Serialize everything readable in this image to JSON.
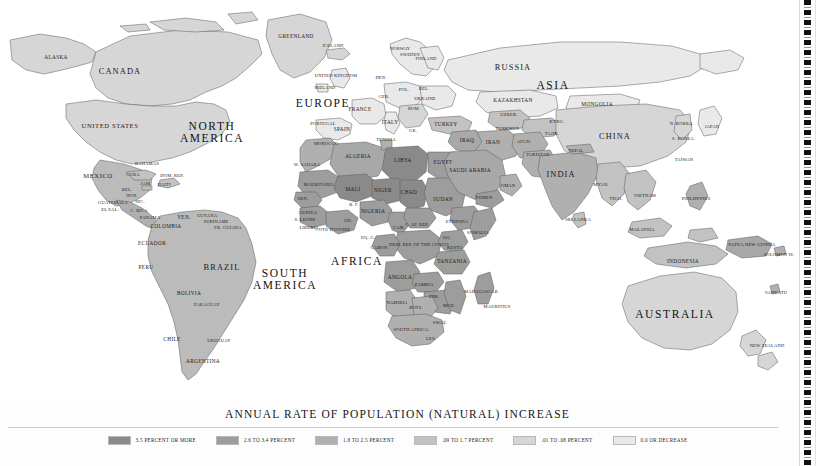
{
  "legend": {
    "title": "ANNUAL RATE OF POPULATION (NATURAL) INCREASE",
    "items": [
      {
        "label": "3.5 PERCENT OR MORE",
        "color": "#8a8a8a"
      },
      {
        "label": "2.6 TO 3.4 PERCENT",
        "color": "#9d9d9d"
      },
      {
        "label": "1.8 TO 2.5 PERCENT",
        "color": "#b0b0b0"
      },
      {
        "label": ".09 TO 1.7 PERCENT",
        "color": "#c2c2c2"
      },
      {
        "label": ".01 TO .08 PERCENT",
        "color": "#d6d6d6"
      },
      {
        "label": "0.0 OR DECREASE",
        "color": "#e9e9e9"
      }
    ]
  },
  "map": {
    "ocean_color": "#ffffff",
    "border_color": "#4a4a4a",
    "continents": [
      {
        "name": "NORTH\nAMERICA",
        "x": 212,
        "y": 133
      },
      {
        "name": "SOUTH\nAMERICA",
        "x": 285,
        "y": 280
      },
      {
        "name": "EUROPE",
        "x": 323,
        "y": 104
      },
      {
        "name": "AFRICA",
        "x": 357,
        "y": 262
      },
      {
        "name": "ASIA",
        "x": 553,
        "y": 86
      },
      {
        "name": "AUSTRALIA",
        "x": 675,
        "y": 315
      }
    ],
    "countries": [
      {
        "name": "ALASKA",
        "x": 56,
        "y": 58,
        "size": "c-sm"
      },
      {
        "name": "CANADA",
        "x": 120,
        "y": 72,
        "size": "c-big"
      },
      {
        "name": "UNITED STATES",
        "x": 110,
        "y": 126,
        "size": "c-mid"
      },
      {
        "name": "MEXICO",
        "x": 98,
        "y": 176,
        "size": "c-mid"
      },
      {
        "name": "GREENLAND",
        "x": 296,
        "y": 37,
        "size": "c-sm"
      },
      {
        "name": "ICELAND",
        "x": 333,
        "y": 46,
        "size": "c-xs"
      },
      {
        "name": "BAHAMAS",
        "x": 147,
        "y": 164,
        "size": "c-xs"
      },
      {
        "name": "CUBA",
        "x": 133,
        "y": 175,
        "size": "c-xs"
      },
      {
        "name": "DOM. REP.",
        "x": 172,
        "y": 176,
        "size": "c-xs"
      },
      {
        "name": "JAM.",
        "x": 146,
        "y": 184,
        "size": "c-xs"
      },
      {
        "name": "HAITI",
        "x": 164,
        "y": 185,
        "size": "c-xs"
      },
      {
        "name": "BEL.",
        "x": 127,
        "y": 190,
        "size": "c-xs"
      },
      {
        "name": "HON.",
        "x": 132,
        "y": 196,
        "size": "c-xs"
      },
      {
        "name": "GUATEMALA",
        "x": 113,
        "y": 203,
        "size": "c-xs"
      },
      {
        "name": "EL SAL.",
        "x": 110,
        "y": 210,
        "size": "c-xs"
      },
      {
        "name": "NIC.",
        "x": 140,
        "y": 202,
        "size": "c-xs"
      },
      {
        "name": "C. RICA",
        "x": 139,
        "y": 211,
        "size": "c-xs"
      },
      {
        "name": "PANAMA",
        "x": 150,
        "y": 218,
        "size": "c-xs"
      },
      {
        "name": "VEN.",
        "x": 184,
        "y": 218,
        "size": "c-sm"
      },
      {
        "name": "GUYANA",
        "x": 207,
        "y": 216,
        "size": "c-xs"
      },
      {
        "name": "SURINAME",
        "x": 216,
        "y": 222,
        "size": "c-xs"
      },
      {
        "name": "FR. GUIANA",
        "x": 228,
        "y": 228,
        "size": "c-xs"
      },
      {
        "name": "COLOMBIA",
        "x": 166,
        "y": 227,
        "size": "c-sm"
      },
      {
        "name": "ECUADOR",
        "x": 152,
        "y": 244,
        "size": "c-sm"
      },
      {
        "name": "PERU",
        "x": 146,
        "y": 268,
        "size": "c-sm"
      },
      {
        "name": "BRAZIL",
        "x": 222,
        "y": 268,
        "size": "c-big"
      },
      {
        "name": "BOLIVIA",
        "x": 189,
        "y": 294,
        "size": "c-sm"
      },
      {
        "name": "PARAGUAY",
        "x": 207,
        "y": 305,
        "size": "c-xs"
      },
      {
        "name": "CHILE",
        "x": 172,
        "y": 340,
        "size": "c-sm"
      },
      {
        "name": "URUGUAY",
        "x": 219,
        "y": 341,
        "size": "c-xs"
      },
      {
        "name": "ARGENTINA",
        "x": 203,
        "y": 362,
        "size": "c-sm"
      },
      {
        "name": "NORWAY",
        "x": 400,
        "y": 49,
        "size": "c-xs"
      },
      {
        "name": "SWEDEN",
        "x": 410,
        "y": 55,
        "size": "c-xs"
      },
      {
        "name": "FINLAND",
        "x": 426,
        "y": 59,
        "size": "c-xs"
      },
      {
        "name": "UNITED KINGDOM",
        "x": 336,
        "y": 76,
        "size": "c-xs"
      },
      {
        "name": "IRELAND",
        "x": 325,
        "y": 88,
        "size": "c-xs"
      },
      {
        "name": "DEN.",
        "x": 381,
        "y": 78,
        "size": "c-xs"
      },
      {
        "name": "POL.",
        "x": 404,
        "y": 90,
        "size": "c-xs"
      },
      {
        "name": "BEL.",
        "x": 424,
        "y": 89,
        "size": "c-xs"
      },
      {
        "name": "GER.",
        "x": 384,
        "y": 97,
        "size": "c-xs"
      },
      {
        "name": "UKRAINE",
        "x": 425,
        "y": 99,
        "size": "c-xs"
      },
      {
        "name": "FRANCE",
        "x": 360,
        "y": 110,
        "size": "c-sm"
      },
      {
        "name": "ROM.",
        "x": 414,
        "y": 109,
        "size": "c-xs"
      },
      {
        "name": "PORTUGAL",
        "x": 323,
        "y": 124,
        "size": "c-xs"
      },
      {
        "name": "SPAIN",
        "x": 342,
        "y": 130,
        "size": "c-sm"
      },
      {
        "name": "ITALY",
        "x": 390,
        "y": 123,
        "size": "c-sm"
      },
      {
        "name": "GR.",
        "x": 413,
        "y": 131,
        "size": "c-xs"
      },
      {
        "name": "TURKEY",
        "x": 446,
        "y": 125,
        "size": "c-sm"
      },
      {
        "name": "TUNISIA",
        "x": 386,
        "y": 140,
        "size": "c-xs"
      },
      {
        "name": "MOROCCO",
        "x": 326,
        "y": 144,
        "size": "c-xs"
      },
      {
        "name": "W. SAHARA",
        "x": 307,
        "y": 165,
        "size": "c-xs"
      },
      {
        "name": "ALGERIA",
        "x": 358,
        "y": 157,
        "size": "c-sm"
      },
      {
        "name": "LIBYA",
        "x": 403,
        "y": 161,
        "size": "c-sm"
      },
      {
        "name": "EGYPT",
        "x": 443,
        "y": 163,
        "size": "c-sm"
      },
      {
        "name": "MAURITANIA",
        "x": 319,
        "y": 185,
        "size": "c-xs"
      },
      {
        "name": "MALI",
        "x": 353,
        "y": 190,
        "size": "c-sm"
      },
      {
        "name": "NIGER",
        "x": 383,
        "y": 191,
        "size": "c-sm"
      },
      {
        "name": "CHAD",
        "x": 409,
        "y": 193,
        "size": "c-sm"
      },
      {
        "name": "SUDAN",
        "x": 443,
        "y": 200,
        "size": "c-sm"
      },
      {
        "name": "SEN.",
        "x": 303,
        "y": 199,
        "size": "c-xs"
      },
      {
        "name": "GUINEA",
        "x": 308,
        "y": 213,
        "size": "c-xs"
      },
      {
        "name": "S. LEONE",
        "x": 305,
        "y": 220,
        "size": "c-xs"
      },
      {
        "name": "LIBERIA",
        "x": 309,
        "y": 228,
        "size": "c-xs"
      },
      {
        "name": "B. F.",
        "x": 354,
        "y": 205,
        "size": "c-xs"
      },
      {
        "name": "NIGERIA",
        "x": 373,
        "y": 212,
        "size": "c-sm"
      },
      {
        "name": "GH.",
        "x": 348,
        "y": 221,
        "size": "c-xs"
      },
      {
        "name": "COTE D'IVOIRE",
        "x": 333,
        "y": 230,
        "size": "c-xs"
      },
      {
        "name": "CAM.",
        "x": 399,
        "y": 228,
        "size": "c-xs"
      },
      {
        "name": "C. AF. REP.",
        "x": 417,
        "y": 225,
        "size": "c-xs"
      },
      {
        "name": "ETHIOPIA",
        "x": 457,
        "y": 222,
        "size": "c-xs"
      },
      {
        "name": "SOMALIA",
        "x": 478,
        "y": 233,
        "size": "c-xs"
      },
      {
        "name": "EQ. G.",
        "x": 368,
        "y": 238,
        "size": "c-xs"
      },
      {
        "name": "GABON",
        "x": 379,
        "y": 248,
        "size": "c-xs"
      },
      {
        "name": "DEM. REP. OF THE CONGO",
        "x": 419,
        "y": 245,
        "size": "c-xs"
      },
      {
        "name": "UG.",
        "x": 447,
        "y": 238,
        "size": "c-xs"
      },
      {
        "name": "KENYA",
        "x": 455,
        "y": 248,
        "size": "c-xs"
      },
      {
        "name": "TANZANIA",
        "x": 452,
        "y": 262,
        "size": "c-sm"
      },
      {
        "name": "ANGOLA",
        "x": 400,
        "y": 278,
        "size": "c-sm"
      },
      {
        "name": "ZAMBIA",
        "x": 424,
        "y": 285,
        "size": "c-xs"
      },
      {
        "name": "NAMIBIA",
        "x": 397,
        "y": 303,
        "size": "c-xs"
      },
      {
        "name": "BOTS.",
        "x": 416,
        "y": 308,
        "size": "c-xs"
      },
      {
        "name": "ZIM.",
        "x": 434,
        "y": 297,
        "size": "c-xs"
      },
      {
        "name": "MOZ.",
        "x": 449,
        "y": 306,
        "size": "c-xs"
      },
      {
        "name": "MADAGASCAR",
        "x": 481,
        "y": 292,
        "size": "c-xs"
      },
      {
        "name": "MAURITIUS",
        "x": 497,
        "y": 307,
        "size": "c-xs"
      },
      {
        "name": "SOUTH AFRICA",
        "x": 411,
        "y": 330,
        "size": "c-xs"
      },
      {
        "name": "SWAZ.",
        "x": 440,
        "y": 323,
        "size": "c-xs"
      },
      {
        "name": "LES.",
        "x": 431,
        "y": 339,
        "size": "c-xs"
      },
      {
        "name": "RUSSIA",
        "x": 513,
        "y": 68,
        "size": "c-big"
      },
      {
        "name": "KAZAKHSTAN",
        "x": 513,
        "y": 101,
        "size": "c-sm"
      },
      {
        "name": "MONGOLIA",
        "x": 597,
        "y": 105,
        "size": "c-sm"
      },
      {
        "name": "UZBEK.",
        "x": 509,
        "y": 115,
        "size": "c-xs"
      },
      {
        "name": "KYRG.",
        "x": 557,
        "y": 122,
        "size": "c-xs"
      },
      {
        "name": "TURKMEN.",
        "x": 508,
        "y": 129,
        "size": "c-xs"
      },
      {
        "name": "TAJIK.",
        "x": 552,
        "y": 134,
        "size": "c-xs"
      },
      {
        "name": "AFGH.",
        "x": 524,
        "y": 142,
        "size": "c-xs"
      },
      {
        "name": "PAKISTAN",
        "x": 538,
        "y": 155,
        "size": "c-xs"
      },
      {
        "name": "IRAQ",
        "x": 467,
        "y": 141,
        "size": "c-sm"
      },
      {
        "name": "IRAN",
        "x": 493,
        "y": 143,
        "size": "c-sm"
      },
      {
        "name": "CHINA",
        "x": 615,
        "y": 137,
        "size": "c-big"
      },
      {
        "name": "N. KOREA",
        "x": 681,
        "y": 124,
        "size": "c-xs"
      },
      {
        "name": "S. KOREA",
        "x": 683,
        "y": 139,
        "size": "c-xs"
      },
      {
        "name": "JAPAN",
        "x": 712,
        "y": 127,
        "size": "c-xs"
      },
      {
        "name": "TAIWAN",
        "x": 684,
        "y": 160,
        "size": "c-xs"
      },
      {
        "name": "NEPAL",
        "x": 576,
        "y": 151,
        "size": "c-xs"
      },
      {
        "name": "SAUDI ARABIA",
        "x": 470,
        "y": 171,
        "size": "c-sm"
      },
      {
        "name": "OMAN",
        "x": 508,
        "y": 186,
        "size": "c-xs"
      },
      {
        "name": "YEMEN",
        "x": 484,
        "y": 198,
        "size": "c-xs"
      },
      {
        "name": "INDIA",
        "x": 561,
        "y": 175,
        "size": "c-big"
      },
      {
        "name": "MYAN.",
        "x": 601,
        "y": 185,
        "size": "c-xs"
      },
      {
        "name": "THAI.",
        "x": 616,
        "y": 199,
        "size": "c-xs"
      },
      {
        "name": "VIETNAM",
        "x": 645,
        "y": 196,
        "size": "c-xs"
      },
      {
        "name": "SRI LANKA",
        "x": 578,
        "y": 220,
        "size": "c-xs"
      },
      {
        "name": "MALAYSIA",
        "x": 642,
        "y": 230,
        "size": "c-xs"
      },
      {
        "name": "INDONESIA",
        "x": 683,
        "y": 262,
        "size": "c-sm"
      },
      {
        "name": "PAPUA NEW GUINEA",
        "x": 752,
        "y": 245,
        "size": "c-xs"
      },
      {
        "name": "SOLOMON IS.",
        "x": 779,
        "y": 255,
        "size": "c-xs"
      },
      {
        "name": "VANUATU",
        "x": 776,
        "y": 293,
        "size": "c-xs"
      },
      {
        "name": "PHILIPPINES",
        "x": 696,
        "y": 199,
        "size": "c-xs"
      },
      {
        "name": "NEW ZEALAND",
        "x": 767,
        "y": 346,
        "size": "c-xs"
      }
    ]
  }
}
